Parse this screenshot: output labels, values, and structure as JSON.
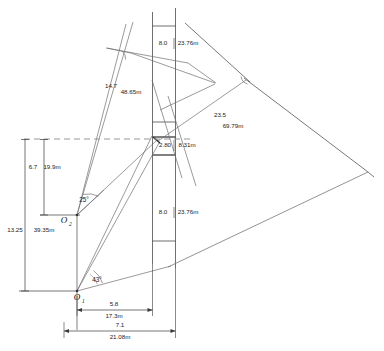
{
  "diagram": {
    "colors": {
      "ray_line": "#6e6e6e",
      "structure_line": "#4a4a4a",
      "dimension_line": "#3a3a3a",
      "dashed_line": "#8a8a8a",
      "text": "#1a1a1a",
      "background": "#ffffff"
    },
    "stations": [
      {
        "id": "station-o1",
        "label": "O",
        "subscript": "1",
        "x": 77,
        "y": 296
      },
      {
        "id": "station-o2",
        "label": "O",
        "subscript": "2",
        "x": 64,
        "y": 219
      }
    ],
    "angles": [
      {
        "id": "angle-at-o2",
        "value": "25°",
        "x": 84,
        "y": 199
      },
      {
        "id": "angle-at-o1",
        "value": "43°",
        "x": 97,
        "y": 279
      }
    ],
    "measurements": [
      {
        "id": "upper-panel-height",
        "near": "8.0",
        "far": "23.76m",
        "near_x": 163,
        "far_x": 188,
        "y": 43
      },
      {
        "id": "upper-left-ray-length",
        "near": "14.7",
        "far": "48.65m",
        "near_x": 111,
        "far_x": 131,
        "near_y": 86,
        "far_y": 92
      },
      {
        "id": "right-ray-length",
        "near": "23.5",
        "far": "69.79m",
        "near_x": 220,
        "far_x": 231,
        "near_y": 115,
        "far_y": 126
      },
      {
        "id": "center-gap-width",
        "near": "2.80",
        "far": "8.31m",
        "near_x": 165,
        "far_x": 186,
        "y": 145
      },
      {
        "id": "lower-panel-height",
        "near": "8.0",
        "far": "23.76m",
        "near_x": 163,
        "far_x": 188,
        "y": 212
      },
      {
        "id": "o2-vertical-offset",
        "near": "6.7",
        "far": "19.9m",
        "near_x": 33,
        "far_x": 50,
        "y": 167
      },
      {
        "id": "o1-vertical-offset",
        "near": "13.25",
        "far": "39.35m",
        "near_x": 15,
        "far_x": 42,
        "y": 230
      },
      {
        "id": "o1-horizontal-near",
        "near": "5.8",
        "far": "17.3m",
        "near_x": 114,
        "far_x": 114,
        "near_y": 303,
        "far_y": 313
      },
      {
        "id": "o1-horizontal-far",
        "near": "7.1",
        "far": "21.08m",
        "near_x": 127,
        "far_x": 127,
        "near_y": 324,
        "far_y": 334
      }
    ]
  }
}
